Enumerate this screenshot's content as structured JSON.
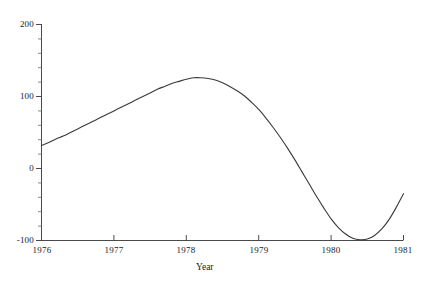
{
  "chart_data": {
    "type": "line",
    "title": "",
    "subtitle": "",
    "xlabel": "Year",
    "ylabel": "",
    "xlim": [
      1976,
      1981
    ],
    "ylim": [
      -100,
      200
    ],
    "grid": false,
    "legend": "none",
    "x_ticks": [
      "1976",
      "1977",
      "1978",
      "1979",
      "1980",
      "1981"
    ],
    "x_tick_values": [
      1976,
      1977,
      1978,
      1979,
      1980,
      1981
    ],
    "y_ticks": [
      "200",
      "100",
      "0",
      "-100"
    ],
    "y_tick_values": [
      200,
      100,
      0,
      -100
    ],
    "y_minor_step": 20,
    "series": [
      {
        "name": "value",
        "color": "#3a3a3a",
        "x": [
          1976.0,
          1976.1,
          1976.2,
          1976.3,
          1976.4,
          1976.5,
          1976.6,
          1976.7,
          1976.8,
          1976.9,
          1977.0,
          1977.1,
          1977.2,
          1977.3,
          1977.4,
          1977.5,
          1977.6,
          1977.7,
          1977.8,
          1977.9,
          1978.0,
          1978.1,
          1978.2,
          1978.3,
          1978.4,
          1978.5,
          1978.6,
          1978.7,
          1978.8,
          1978.9,
          1979.0,
          1979.1,
          1979.2,
          1979.3,
          1979.4,
          1979.5,
          1979.6,
          1979.7,
          1979.8,
          1979.9,
          1980.0,
          1980.1,
          1980.2,
          1980.3,
          1980.4,
          1980.5,
          1980.6,
          1980.7,
          1980.8,
          1980.9,
          1981.0
        ],
        "y": [
          32,
          36,
          41,
          45,
          50,
          55,
          60,
          65,
          70,
          75,
          80,
          85,
          90,
          95,
          100,
          105,
          110,
          114,
          118,
          121,
          124,
          126,
          126,
          125,
          123,
          119,
          114,
          108,
          101,
          92,
          82,
          70,
          57,
          43,
          28,
          12,
          -5,
          -22,
          -39,
          -55,
          -70,
          -82,
          -91,
          -97,
          -99,
          -98,
          -93,
          -84,
          -71,
          -54,
          -35
        ]
      }
    ],
    "annotations": []
  },
  "axes": {
    "x_axis_title": "Year",
    "x_tick_labels": [
      "1976",
      "1977",
      "1978",
      "1979",
      "1980",
      "1981"
    ],
    "y_tick_labels": [
      "200",
      "100",
      "0",
      "-100"
    ]
  }
}
